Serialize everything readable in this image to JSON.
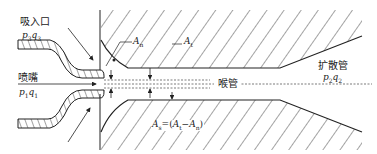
{
  "diagram": {
    "type": "ejector cross-section (jet pump)",
    "colors": {
      "line": "#222222",
      "background": "#ffffff"
    },
    "labels": {
      "suction_inlet": "吸入口",
      "suction_pressure_flow": {
        "p": "p",
        "p_sub": "3",
        "q": "q",
        "q_sub": "3"
      },
      "nozzle": "喷嘴",
      "nozzle_pressure_flow": {
        "p": "p",
        "p_sub": "1",
        "q": "q",
        "q_sub": "1"
      },
      "throat": "喉管",
      "diffuser": "扩散管",
      "diffuser_pressure_flow": {
        "p": "p",
        "p_sub": "2",
        "q": "q",
        "q_sub": "2"
      },
      "area_nozzle": {
        "A": "A",
        "sub": "n"
      },
      "area_throat": {
        "A": "A",
        "sub": "t"
      },
      "area_suction_formula": {
        "lhs": "A",
        "lhs_sub": "s",
        "eq": "=(",
        "a1": "A",
        "a1_sub": "t",
        "minus": "−",
        "a2": "A",
        "a2_sub": "n",
        "close": ")"
      }
    }
  }
}
